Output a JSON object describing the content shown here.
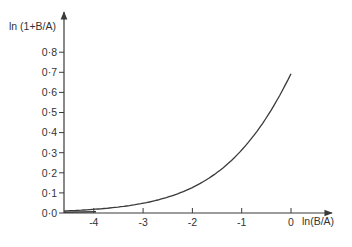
{
  "chart_data": {
    "type": "line",
    "title": "",
    "xlabel": "ln(B/A)",
    "ylabel": "ln (1+B/A)",
    "xlim": [
      -4.6,
      0.8
    ],
    "ylim": [
      0.0,
      0.9
    ],
    "grid": false,
    "legend": null,
    "x_ticks": [
      {
        "value": -4,
        "label": "-4"
      },
      {
        "value": -3,
        "label": "-3"
      },
      {
        "value": -2,
        "label": "-2"
      },
      {
        "value": -1,
        "label": "-1"
      },
      {
        "value": 0,
        "label": "0"
      }
    ],
    "y_ticks": [
      {
        "value": 0.0,
        "label": "0·0"
      },
      {
        "value": 0.1,
        "label": "0·1"
      },
      {
        "value": 0.2,
        "label": "0·2"
      },
      {
        "value": 0.3,
        "label": "0·3"
      },
      {
        "value": 0.4,
        "label": "0·4"
      },
      {
        "value": 0.5,
        "label": "0·5"
      },
      {
        "value": 0.6,
        "label": "0·6"
      },
      {
        "value": 0.7,
        "label": "0·7"
      },
      {
        "value": 0.8,
        "label": "0·8"
      }
    ],
    "series": [
      {
        "name": "ln(1+B/A)",
        "x": [
          -4.6,
          -4.0,
          -3.5,
          -3.0,
          -2.5,
          -2.0,
          -1.5,
          -1.0,
          -0.5,
          0.0
        ],
        "y": [
          0.01,
          0.018,
          0.03,
          0.049,
          0.079,
          0.127,
          0.201,
          0.313,
          0.474,
          0.693
        ]
      }
    ]
  },
  "layout": {
    "origin_x_px": 291,
    "origin_y_px": 213,
    "px_per_x_unit": 49.3,
    "px_per_y_unit": 201,
    "axis_color": "#3a3a3a"
  }
}
